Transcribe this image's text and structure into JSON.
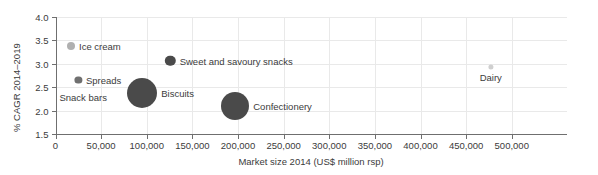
{
  "chart_data": {
    "type": "scatter",
    "title": "",
    "xlabel": "Market size 2014 (US$ million rsp)",
    "ylabel": "% CAGR 2014–2019",
    "xlim": [
      0,
      560000
    ],
    "ylim": [
      1.5,
      4.0
    ],
    "xticks": [
      0,
      50000,
      100000,
      150000,
      200000,
      250000,
      300000,
      350000,
      400000,
      450000,
      500000
    ],
    "xtick_labels": [
      "0",
      "50,000",
      "100,000",
      "150,000",
      "200,000",
      "250,000",
      "300,000",
      "350,000",
      "400,000",
      "450,000",
      "500,000"
    ],
    "yticks": [
      1.5,
      2.0,
      2.5,
      3.0,
      3.5,
      4.0
    ],
    "ytick_labels": [
      "1.5",
      "2.0",
      "2.5",
      "3.0",
      "3.5",
      "4.0"
    ],
    "grid": true,
    "legend": "none",
    "points": [
      {
        "name": "Ice cream",
        "x": 17000,
        "y": 3.38,
        "r": 4.0,
        "color": "#b0b0b0",
        "label": "Ice cream",
        "label_pos": "right"
      },
      {
        "name": "Spreads",
        "x": 25000,
        "y": 2.65,
        "r": 3.6,
        "color": "#707070",
        "label": "Spreads",
        "label_pos": "right"
      },
      {
        "name": "Snack bars",
        "x": 63000,
        "y": 2.28,
        "r": 2.0,
        "color": "#ffffff",
        "label": "Snack bars",
        "label_pos": "left"
      },
      {
        "name": "Biscuits",
        "x": 95000,
        "y": 2.37,
        "r": 15.0,
        "color": "#4a4a4a",
        "label": "Biscuits",
        "label_pos": "right"
      },
      {
        "name": "Sweet and savoury snacks",
        "x": 126000,
        "y": 3.07,
        "r": 5.2,
        "color": "#4a4a4a",
        "label": "Sweet and savoury snacks",
        "label_pos": "right"
      },
      {
        "name": "Confectionery",
        "x": 197000,
        "y": 2.1,
        "r": 14.0,
        "color": "#4a4a4a",
        "label": "Confectionery",
        "label_pos": "right"
      },
      {
        "name": "Dairy",
        "x": 477000,
        "y": 2.93,
        "r": 2.6,
        "color": "#cfcfcf",
        "label": "Dairy",
        "label_pos": "below"
      }
    ]
  },
  "colors": {
    "axis": "#6f6f6f",
    "grid": "#e9e9e9",
    "text": "#3b3b3b",
    "background": "#ffffff"
  }
}
